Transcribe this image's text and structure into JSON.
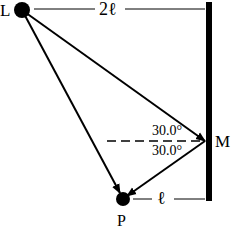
{
  "diagram": {
    "labels": {
      "source": "L",
      "mirror_point": "M",
      "observer": "P",
      "top_distance": "2ℓ",
      "bottom_distance": "ℓ",
      "angle_incidence": "30.0°",
      "angle_reflection": "30.0°"
    },
    "colors": {
      "ink": "#000000",
      "background": "#ffffff"
    }
  }
}
